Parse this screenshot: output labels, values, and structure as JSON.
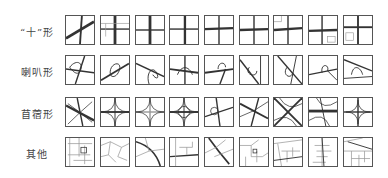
{
  "figure": {
    "rows": [
      {
        "label": "“十”形",
        "type": "cross",
        "tile_count": 9
      },
      {
        "label": "喇叭形",
        "type": "trumpet",
        "tile_count": 9
      },
      {
        "label": "苜蓿形",
        "type": "cloverleaf",
        "tile_count": 9
      },
      {
        "label": "其他",
        "type": "other",
        "tile_count": 9
      }
    ]
  },
  "colors": {
    "border": "#555555",
    "road": "#333333",
    "road_light": "#888888",
    "background": "#ffffff"
  }
}
